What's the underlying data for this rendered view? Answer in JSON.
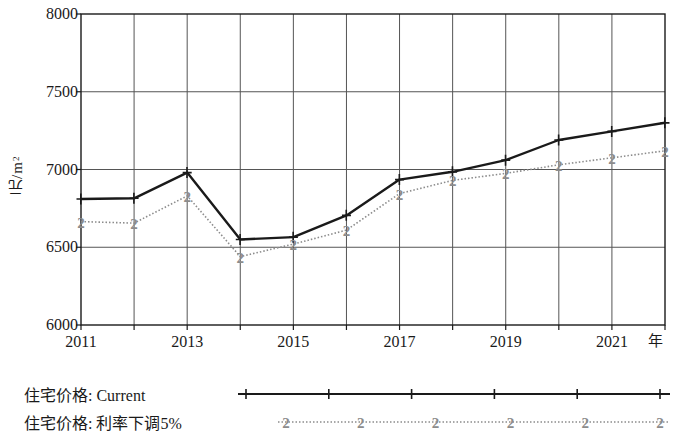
{
  "chart_data": {
    "type": "line",
    "title": "",
    "xlabel": "年",
    "ylabel": "元/m2",
    "ylabel_base": "元/m",
    "ylabel_sup": "2",
    "x": [
      2011,
      2012,
      2013,
      2014,
      2015,
      2016,
      2017,
      2018,
      2019,
      2020,
      2021,
      2022
    ],
    "xlim": [
      2011,
      2022
    ],
    "ylim": [
      6000,
      8000
    ],
    "yticks": [
      6000,
      6500,
      7000,
      7500,
      8000
    ],
    "xticks": [
      2011,
      2012,
      2013,
      2014,
      2015,
      2016,
      2017,
      2018,
      2019,
      2020,
      2021,
      2022
    ],
    "xtick_labels": [
      "2011",
      "",
      "2013",
      "",
      "2015",
      "",
      "2017",
      "",
      "2019",
      "",
      "2021",
      ""
    ],
    "grid": true,
    "legend_position": "below",
    "series": [
      {
        "name": "住宅价格: Current",
        "marker": "+",
        "linestyle": "solid",
        "color": "#1a1a1a",
        "values": [
          6810,
          6815,
          6980,
          6550,
          6565,
          6705,
          6935,
          6985,
          7060,
          7190,
          7245,
          7300
        ]
      },
      {
        "name": "住宅价格: 利率下调5%",
        "marker": "2",
        "linestyle": "dotted",
        "color": "#8c8c8c",
        "values": [
          6665,
          6655,
          6830,
          6440,
          6520,
          6610,
          6845,
          6930,
          6975,
          7030,
          7075,
          7120
        ]
      }
    ]
  },
  "legend": {
    "items": [
      {
        "label": "住宅价格: Current",
        "marker": "+",
        "color": "#1a1a1a",
        "style": "solid"
      },
      {
        "label": "住宅价格: 利率下调5%",
        "marker": "2",
        "color": "#8c8c8c",
        "style": "dotted"
      }
    ]
  },
  "axes": {
    "y_title_main": "元/m",
    "y_title_sup": "2",
    "x_title": "年",
    "y_labels": [
      "8000",
      "7500",
      "7000",
      "6500",
      "6000"
    ],
    "x_labels": [
      "2011",
      "2013",
      "2015",
      "2017",
      "2019",
      "2021"
    ]
  }
}
